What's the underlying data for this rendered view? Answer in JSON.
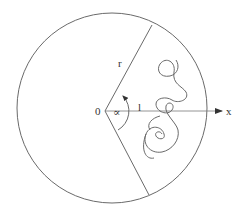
{
  "diagram": {
    "title": "",
    "labels": {
      "radius": "r",
      "origin": "0",
      "angle": "∝",
      "length": "l",
      "axis": "x"
    },
    "colors": {
      "stroke": "#6a6a6a",
      "text": "#333333",
      "background": "#ffffff"
    },
    "geometry": {
      "circle": {
        "cx": 112,
        "cy": 108,
        "r": 95
      },
      "vertex": {
        "x": 105,
        "y": 111
      },
      "upper_ray_end": {
        "x": 152,
        "y": 25
      },
      "lower_ray_end": {
        "x": 149,
        "y": 195
      },
      "axis_end": {
        "x": 222,
        "y": 111
      }
    },
    "elements": [
      "boundary circle",
      "wedge of opening angle alpha bounded by two radii",
      "x axis from origin with arrow",
      "random walk path inside wedge with small loops",
      "curved arrow indicating angle"
    ]
  }
}
